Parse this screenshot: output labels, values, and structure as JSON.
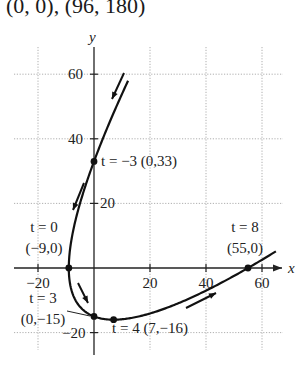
{
  "caption": "(0, 0), (96, 180)",
  "chart_data": {
    "type": "line",
    "title": "",
    "xlabel": "x",
    "ylabel": "y",
    "parametric": {
      "x": "t^2 - 9",
      "y": "t^2 - 8t",
      "t_range": [
        -4.6,
        8.6
      ]
    },
    "xlim": [
      -26,
      68
    ],
    "ylim": [
      -24,
      68
    ],
    "grid": true,
    "x_ticks": [
      -20,
      20,
      40,
      60
    ],
    "y_ticks": [
      60,
      40,
      20,
      -20
    ],
    "x_tick_labels": [
      "−20",
      "20",
      "40",
      "60"
    ],
    "y_tick_labels": [
      "60",
      "40",
      "20",
      "−20"
    ],
    "points": [
      {
        "t": -3,
        "x": 0,
        "y": 33,
        "label": "t = −3 (0,33)"
      },
      {
        "t": 0,
        "x": -9,
        "y": 0,
        "label_line1": "t = 0",
        "label_line2": "(−9,0)"
      },
      {
        "t": 3,
        "x": 0,
        "y": -15,
        "label_line1": "t = 3",
        "label_line2": "(0,−15)"
      },
      {
        "t": 4,
        "x": 7,
        "y": -16,
        "label": "t = 4 (7,−16)"
      },
      {
        "t": 8,
        "x": 55,
        "y": 0,
        "label_line1": "t = 8",
        "label_line2": "(55,0)"
      }
    ],
    "direction_arrows": [
      "down-left along upper branch",
      "down-left near y=20",
      "down-right near (-5,-8)",
      "up-right near (35,-10)"
    ]
  },
  "colors": {
    "curve": "#111111",
    "grid": "#9a9a9a",
    "axis": "#222222",
    "background": "#ffffff"
  }
}
